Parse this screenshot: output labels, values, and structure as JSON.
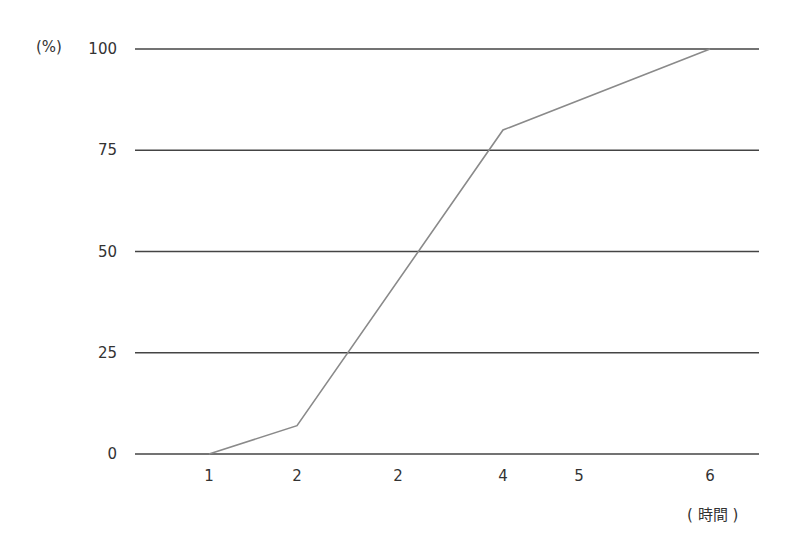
{
  "chart_data": {
    "type": "line",
    "title": "",
    "xlabel": "( 時間 )",
    "ylabel": "(%)",
    "x_tick_labels": [
      "1",
      "2",
      "2",
      "4",
      "5",
      "6"
    ],
    "y_ticks": [
      0,
      25,
      50,
      75,
      100
    ],
    "y_tick_labels": [
      "0",
      "25",
      "50",
      "75",
      "100"
    ],
    "ylim": [
      0,
      100
    ],
    "grid": "horizontal",
    "legend": null,
    "series": [
      {
        "name": "cumulative",
        "points": [
          {
            "x_label": "1",
            "x_index": 0,
            "y": 0
          },
          {
            "x_label": "2",
            "x_index": 1,
            "y": 7
          },
          {
            "x_label": "4",
            "x_index": 3,
            "y": 80
          },
          {
            "x_label": "6",
            "x_index": 5,
            "y": 100
          }
        ]
      }
    ],
    "colors": {
      "grid": "#444444",
      "line": "#8a8a8a",
      "text": "#333333"
    }
  }
}
